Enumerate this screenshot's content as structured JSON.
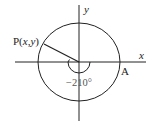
{
  "diagram": {
    "type": "unit-circle-angle",
    "axes": {
      "x_label": "x",
      "y_label": "y"
    },
    "point_P": {
      "prefix": "P(",
      "x": "x",
      "comma": ",",
      "y": "y",
      "suffix": ")"
    },
    "point_A": {
      "label": "A"
    },
    "angle": {
      "label": "−210°",
      "value_degrees": -210
    },
    "colors": {
      "stroke": "#222222",
      "background": "#ffffff"
    }
  }
}
